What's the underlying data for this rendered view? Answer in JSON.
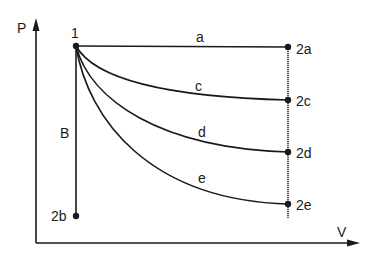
{
  "diagram": {
    "axes": {
      "y_label": "P",
      "x_label": "V"
    },
    "points": {
      "p1": "1",
      "p2a": "2a",
      "p2b": "2b",
      "p2c": "2c",
      "p2d": "2d",
      "p2e": "2e"
    },
    "processes": {
      "a": "a",
      "B": "B",
      "c": "c",
      "d": "d",
      "e": "e"
    },
    "colors": {
      "ink": "#1a1a1a",
      "background": "#ffffff"
    }
  }
}
